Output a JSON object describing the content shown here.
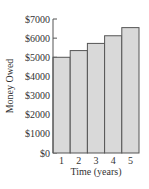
{
  "chart_data": {
    "type": "bar",
    "title": "",
    "xlabel": "Time (years)",
    "ylabel": "Money Owed",
    "categories": [
      "1",
      "2",
      "3",
      "4",
      "5"
    ],
    "values": [
      5000,
      5350,
      5725,
      6125,
      6550
    ],
    "ylim": [
      0,
      7000
    ],
    "yticks": [
      0,
      1000,
      2000,
      3000,
      4000,
      5000,
      6000,
      7000
    ],
    "ytick_labels": [
      "$0",
      "$1000",
      "$2000",
      "$3000",
      "$4000",
      "$5000",
      "$6000",
      "$7000"
    ],
    "grid": false,
    "legend": null,
    "colors": {
      "bar_fill": "#d9d9d9",
      "bar_edge": "#555555",
      "axis": "#555555"
    }
  }
}
